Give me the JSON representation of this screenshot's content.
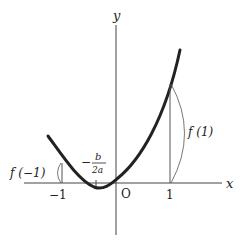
{
  "diagram": {
    "type": "parabola-graph",
    "axes": {
      "x_label": "x",
      "y_label": "y",
      "origin_label": "O"
    },
    "ticks": {
      "neg_one": "−1",
      "one": "1"
    },
    "vertex_label": {
      "prefix": "−",
      "numerator": "b",
      "denominator": "2a"
    },
    "annotations": {
      "f_neg_one": "f (−1)",
      "f_one": "f (1)"
    },
    "colors": {
      "curve": "#222222",
      "axis": "#444444",
      "thin": "#555555"
    }
  }
}
